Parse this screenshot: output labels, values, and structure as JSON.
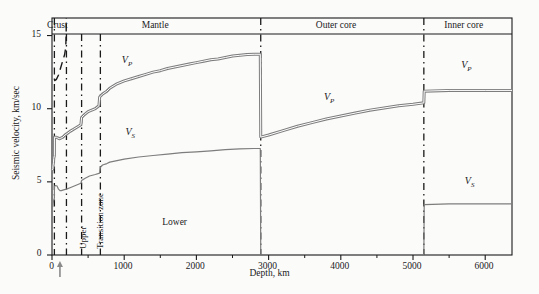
{
  "chart_data": {
    "type": "line",
    "title": "",
    "xlabel": "Depth, km",
    "ylabel": "Seismic velocity, km/sec",
    "xlim": [
      0,
      6371
    ],
    "ylim": [
      0,
      16.2
    ],
    "grid": false,
    "legend": "inline-curve-labels",
    "xticks": [
      0,
      1000,
      2000,
      3000,
      4000,
      5000,
      6000
    ],
    "xticklabels": [
      "0",
      "1000",
      "2000",
      "3000",
      "4000",
      "5000",
      "6000"
    ],
    "xminorticks": [
      500,
      1500,
      2500,
      3500,
      4500,
      5500
    ],
    "yticks": [
      0,
      5,
      10,
      15
    ],
    "yticklabels": [
      "0",
      "5",
      "10",
      "15"
    ],
    "series": [
      {
        "name": "V_P",
        "label": "VP",
        "style": "double-line",
        "points": [
          [
            0,
            5.8
          ],
          [
            12,
            5.9
          ],
          [
            14,
            6.1
          ],
          [
            20,
            6.3
          ],
          [
            24,
            6.6
          ],
          [
            33,
            6.8
          ],
          [
            34,
            8.05
          ],
          [
            60,
            8.05
          ],
          [
            80,
            8.0
          ],
          [
            100,
            7.95
          ],
          [
            120,
            7.98
          ],
          [
            150,
            8.05
          ],
          [
            180,
            8.2
          ],
          [
            210,
            8.3
          ],
          [
            250,
            8.45
          ],
          [
            300,
            8.6
          ],
          [
            350,
            8.75
          ],
          [
            400,
            8.9
          ],
          [
            410,
            9.4
          ],
          [
            450,
            9.6
          ],
          [
            500,
            9.8
          ],
          [
            550,
            9.9
          ],
          [
            600,
            10.0
          ],
          [
            650,
            10.2
          ],
          [
            660,
            10.8
          ],
          [
            700,
            11.0
          ],
          [
            760,
            11.2
          ],
          [
            800,
            11.4
          ],
          [
            900,
            11.7
          ],
          [
            1000,
            11.9
          ],
          [
            1100,
            12.05
          ],
          [
            1200,
            12.2
          ],
          [
            1300,
            12.35
          ],
          [
            1400,
            12.5
          ],
          [
            1500,
            12.6
          ],
          [
            1600,
            12.75
          ],
          [
            1700,
            12.85
          ],
          [
            1800,
            12.95
          ],
          [
            1900,
            13.05
          ],
          [
            2000,
            13.15
          ],
          [
            2100,
            13.25
          ],
          [
            2200,
            13.35
          ],
          [
            2300,
            13.4
          ],
          [
            2400,
            13.5
          ],
          [
            2500,
            13.6
          ],
          [
            2600,
            13.65
          ],
          [
            2700,
            13.7
          ],
          [
            2800,
            13.72
          ],
          [
            2885,
            13.72
          ],
          [
            2891,
            8.06
          ],
          [
            3000,
            8.2
          ],
          [
            3200,
            8.5
          ],
          [
            3400,
            8.8
          ],
          [
            3600,
            9.05
          ],
          [
            3800,
            9.3
          ],
          [
            4000,
            9.5
          ],
          [
            4200,
            9.7
          ],
          [
            4400,
            9.9
          ],
          [
            4600,
            10.05
          ],
          [
            4800,
            10.2
          ],
          [
            5000,
            10.3
          ],
          [
            5150,
            10.4
          ],
          [
            5155,
            11.2
          ],
          [
            5500,
            11.25
          ],
          [
            6000,
            11.25
          ],
          [
            6371,
            11.25
          ]
        ]
      },
      {
        "name": "V_S",
        "label": "VS",
        "style": "single-line",
        "points": [
          [
            0,
            3.2
          ],
          [
            10,
            3.3
          ],
          [
            14,
            3.5
          ],
          [
            20,
            3.65
          ],
          [
            28,
            3.8
          ],
          [
            33,
            3.9
          ],
          [
            34,
            4.7
          ],
          [
            50,
            4.75
          ],
          [
            70,
            4.72
          ],
          [
            90,
            4.5
          ],
          [
            110,
            4.4
          ],
          [
            130,
            4.4
          ],
          [
            160,
            4.45
          ],
          [
            200,
            4.5
          ],
          [
            250,
            4.6
          ],
          [
            300,
            4.7
          ],
          [
            350,
            4.8
          ],
          [
            400,
            4.9
          ],
          [
            410,
            5.1
          ],
          [
            460,
            5.25
          ],
          [
            520,
            5.4
          ],
          [
            600,
            5.5
          ],
          [
            660,
            5.6
          ],
          [
            670,
            6.0
          ],
          [
            700,
            6.15
          ],
          [
            760,
            6.25
          ],
          [
            800,
            6.35
          ],
          [
            900,
            6.45
          ],
          [
            1000,
            6.55
          ],
          [
            1200,
            6.7
          ],
          [
            1400,
            6.8
          ],
          [
            1600,
            6.9
          ],
          [
            1800,
            7.0
          ],
          [
            2000,
            7.05
          ],
          [
            2200,
            7.12
          ],
          [
            2400,
            7.2
          ],
          [
            2600,
            7.25
          ],
          [
            2800,
            7.28
          ],
          [
            2885,
            7.28
          ],
          [
            2891,
            0
          ],
          [
            5150,
            0
          ],
          [
            5155,
            3.45
          ],
          [
            5500,
            3.5
          ],
          [
            6000,
            3.5
          ],
          [
            6371,
            3.5
          ]
        ]
      },
      {
        "name": "dashed-upper-branch",
        "label": "",
        "style": "dashed",
        "points": [
          [
            30,
            11.9
          ],
          [
            60,
            12.0
          ],
          [
            90,
            12.3
          ],
          [
            120,
            12.8
          ],
          [
            150,
            13.3
          ],
          [
            175,
            13.7
          ],
          [
            190,
            14.2
          ],
          [
            196,
            15.0
          ],
          [
            198,
            16.0
          ],
          [
            198,
            16.2
          ]
        ]
      }
    ],
    "boundaries": [
      {
        "depth": 33,
        "label": "Moho",
        "style": "dash-dot"
      },
      {
        "depth": 200,
        "label": "crust-mantle-divider",
        "style": "dash-dot"
      },
      {
        "depth": 410,
        "label": "upper-transition",
        "style": "dash-dot"
      },
      {
        "depth": 670,
        "label": "transition-lower",
        "style": "dash-dot"
      },
      {
        "depth": 2891,
        "label": "core-mantle-boundary",
        "style": "dash-dot"
      },
      {
        "depth": 5150,
        "label": "inner-core-boundary",
        "style": "dash-dot"
      }
    ],
    "region_labels": [
      {
        "text": "Crust",
        "depth": 105,
        "name": "region-crust"
      },
      {
        "text": "Mantle",
        "depth": 1450,
        "name": "region-mantle"
      },
      {
        "text": "Outer core",
        "depth": 4000,
        "name": "region-outer-core"
      },
      {
        "text": "Inner core",
        "depth": 5780,
        "name": "region-inner-core"
      }
    ],
    "zone_labels": [
      {
        "text": "Upper",
        "depth": 300,
        "name": "zone-upper"
      },
      {
        "text": "Transition zone",
        "depth": 540,
        "name": "zone-transition"
      },
      {
        "text": "Lower",
        "depth": 1700,
        "velocity": 2.2,
        "name": "zone-lower"
      }
    ],
    "curve_labels": [
      {
        "text": "V",
        "sub": "P",
        "depth": 1050,
        "velocity": 12.85,
        "name": "vp-label-mantle"
      },
      {
        "text": "V",
        "sub": "S",
        "depth": 1100,
        "velocity": 7.9,
        "name": "vs-label-mantle"
      },
      {
        "text": "V",
        "sub": "P",
        "depth": 3850,
        "velocity": 10.3,
        "name": "vp-label-outer-core"
      },
      {
        "text": "V",
        "sub": "P",
        "depth": 5750,
        "velocity": 12.5,
        "name": "vp-label-inner-core"
      },
      {
        "text": "V",
        "sub": "S",
        "depth": 5800,
        "velocity": 4.6,
        "name": "vs-label-inner-core"
      }
    ],
    "annotations": [
      {
        "type": "arrow-up",
        "depth": 110,
        "name": "depth-marker-arrow"
      }
    ],
    "colors": {
      "axis": "#1a1a1a",
      "curve": "#7d7d7d",
      "dashed": "#1a1a1a",
      "background": "#fbfbfa",
      "text": "#1a1a1a"
    }
  },
  "axis": {
    "ylabel": "Seismic velocity, km/sec",
    "xlabel": "Depth, km"
  }
}
